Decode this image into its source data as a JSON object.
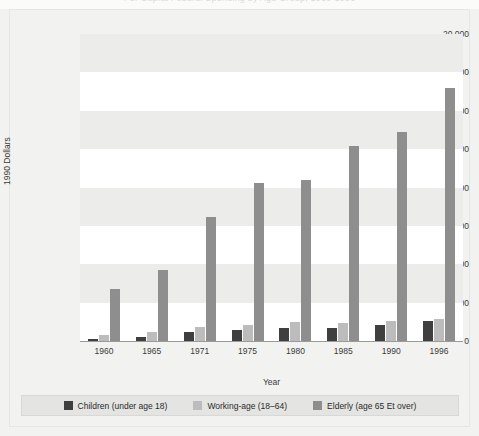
{
  "figure": {
    "clipped_title": "Per Capita Federal Spending by Age Group, 1960-1996",
    "background_color": "#f2f2f0",
    "plot_background_color": "#ffffff",
    "band_color": "#ececea"
  },
  "legend": {
    "position": "bottom",
    "items": [
      {
        "label": "Children (under age 18)",
        "color": "#3f3f3f"
      },
      {
        "label": "Working-age (18–64)",
        "color": "#bcbcbc"
      },
      {
        "label": "Elderly (age 65 Et over)",
        "color": "#8e8e8e"
      }
    ]
  },
  "chart_data": {
    "type": "bar",
    "title": "",
    "xlabel": "Year",
    "ylabel": "1990 Dollars",
    "categories": [
      "1960",
      "1965",
      "1971",
      "1975",
      "1980",
      "1985",
      "1990",
      "1996"
    ],
    "series": [
      {
        "name": "Children (under age 18)",
        "color": "#3f3f3f",
        "values": [
          150,
          250,
          600,
          700,
          850,
          850,
          1050,
          1300
        ]
      },
      {
        "name": "Working-age (18–64)",
        "color": "#bcbcbc",
        "values": [
          400,
          600,
          900,
          1050,
          1250,
          1200,
          1300,
          1450
        ]
      },
      {
        "name": "Elderly (age 65 Et over)",
        "color": "#8e8e8e",
        "values": [
          3400,
          4600,
          8100,
          10300,
          10500,
          12700,
          13600,
          16500
        ]
      }
    ],
    "ylim": [
      0,
      20000
    ],
    "yticks": [
      0,
      2500,
      5000,
      7500,
      10000,
      12500,
      15000,
      17500,
      20000
    ],
    "ytick_labels": [
      "0",
      "2,500",
      "5,000",
      "7,500",
      "10,000",
      "12,500",
      "15,000",
      "17,500",
      "20,000"
    ],
    "grid": false,
    "banded_background": true,
    "legend_position": "bottom"
  }
}
